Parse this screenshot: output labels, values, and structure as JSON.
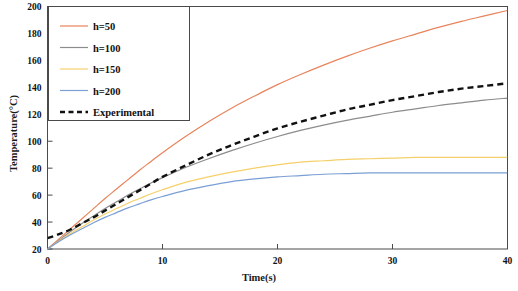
{
  "chart_data": {
    "type": "line",
    "title": "",
    "xlabel": "Time(s)",
    "ylabel": "Temperature(°C)",
    "xlim": [
      0,
      40
    ],
    "ylim": [
      20,
      200
    ],
    "xticks": [
      0,
      10,
      20,
      30,
      40
    ],
    "yticks": [
      20,
      40,
      60,
      80,
      100,
      120,
      140,
      160,
      180,
      200
    ],
    "xticklabels": [
      "0",
      "10",
      "20",
      "30",
      "40"
    ],
    "yticklabels": [
      "20",
      "40",
      "60",
      "80",
      "100",
      "120",
      "140",
      "160",
      "180",
      "200"
    ],
    "grid": false,
    "legend_position": "upper-left",
    "x": [
      0,
      1,
      2,
      3,
      4,
      5,
      6,
      7,
      8,
      9,
      10,
      12,
      14,
      16,
      18,
      20,
      22,
      24,
      26,
      28,
      30,
      32,
      34,
      36,
      38,
      40
    ],
    "series": [
      {
        "name": "h=50",
        "label": "h=50",
        "color": "#E8845C",
        "style": "solid",
        "values": [
          20,
          27.5,
          35,
          42.5,
          50,
          57.5,
          64.5,
          71.5,
          78.5,
          85,
          91.5,
          103.5,
          114.5,
          124.5,
          133.5,
          142,
          149.5,
          156.5,
          163,
          169,
          174.5,
          179.5,
          184.5,
          189,
          193,
          197
        ]
      },
      {
        "name": "h=100",
        "label": "h=100",
        "color": "#8C8C8C",
        "style": "solid",
        "values": [
          20,
          26.5,
          33,
          39,
          44.5,
          50,
          55,
          60,
          64.5,
          69,
          73,
          80.5,
          87,
          93,
          98.5,
          103.5,
          108,
          112,
          115.5,
          118.5,
          121.5,
          124,
          126.5,
          128.5,
          130.5,
          132
        ]
      },
      {
        "name": "h=150",
        "label": "h=150",
        "color": "#F5D06A",
        "style": "solid",
        "values": [
          20,
          26,
          31.5,
          36.5,
          41.5,
          46,
          50,
          54,
          57.5,
          61,
          64,
          69.5,
          73.5,
          77,
          80,
          82.5,
          84.5,
          85.5,
          86.5,
          87,
          87.5,
          88,
          88,
          88,
          88,
          88
        ]
      },
      {
        "name": "h=200",
        "label": "h=200",
        "color": "#7B9FD4",
        "style": "solid",
        "values": [
          20,
          25.5,
          30.5,
          35,
          39.5,
          43.5,
          47,
          50.5,
          53.5,
          56.5,
          59,
          63.5,
          67,
          70,
          72,
          73.5,
          74.5,
          75.5,
          76,
          76.5,
          76.5,
          76.5,
          76.5,
          76.5,
          76.5,
          76.5
        ]
      },
      {
        "name": "Experimental",
        "label": "Experimental",
        "color": "#111111",
        "style": "dashed",
        "values": [
          28,
          31,
          34.5,
          39,
          43.5,
          48.5,
          53.5,
          58.5,
          63.5,
          68.5,
          73.5,
          82,
          90,
          97,
          103.5,
          109.5,
          114.5,
          119,
          123.5,
          127,
          130.5,
          133.5,
          136.5,
          139,
          141,
          143
        ]
      }
    ]
  },
  "legend": {
    "entries": [
      {
        "label": "h=50"
      },
      {
        "label": "h=100"
      },
      {
        "label": "h=150"
      },
      {
        "label": "h=200"
      },
      {
        "label": "Experimental"
      }
    ]
  },
  "axes": {
    "x_title": "Time(s)",
    "y_title": "Temperature(°C)"
  }
}
